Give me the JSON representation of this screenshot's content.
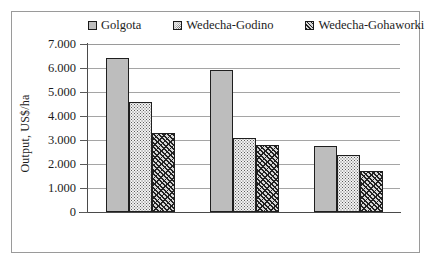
{
  "chart_data": {
    "type": "bar",
    "title": "",
    "xlabel": "",
    "ylabel": "Output, US$/ha",
    "ylim": [
      0,
      7000
    ],
    "grid": true,
    "legend_position": "top",
    "categories": [
      "",
      "",
      ""
    ],
    "series": [
      {
        "name": "Golgota",
        "values": [
          6420,
          5930,
          2750
        ],
        "pattern": "solid-gray",
        "color": "#bdbdbd"
      },
      {
        "name": "Wedecha-Godino",
        "values": [
          4570,
          3100,
          2370
        ],
        "pattern": "dotted",
        "color": "#f2f2f2"
      },
      {
        "name": "Wedecha-Gohaworki",
        "values": [
          3300,
          2810,
          1720
        ],
        "pattern": "hatch",
        "color": "#d8d8d8"
      }
    ],
    "y_ticks": [
      {
        "value": 7000,
        "label": "7.000"
      },
      {
        "value": 6000,
        "label": "6.000"
      },
      {
        "value": 5000,
        "label": "5.000"
      },
      {
        "value": 4000,
        "label": "4.000"
      },
      {
        "value": 3000,
        "label": "3.000"
      },
      {
        "value": 2000,
        "label": "2.000"
      },
      {
        "value": 1000,
        "label": "1.000"
      },
      {
        "value": 0,
        "label": "0"
      }
    ]
  },
  "legend": {
    "items": [
      {
        "label": "Golgota"
      },
      {
        "label": "Wedecha-Godino"
      },
      {
        "label": "Wedecha-Gohaworki"
      }
    ]
  },
  "axis": {
    "y_title": "Output, US$/ha"
  }
}
